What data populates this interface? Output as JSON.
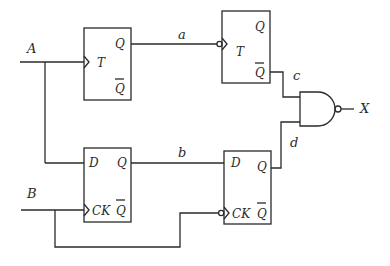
{
  "diagram": {
    "type": "logic-circuit",
    "inputs": {
      "a_input": "A",
      "b_input": "B"
    },
    "output": "X",
    "signals": {
      "a": "a",
      "b": "b",
      "c": "c",
      "d": "d"
    },
    "flipflops": [
      {
        "id": "ff1",
        "type": "T",
        "pins": {
          "in": "T",
          "q": "Q",
          "qbar": "Q"
        },
        "clock_inverted": false
      },
      {
        "id": "ff2",
        "type": "T",
        "pins": {
          "in": "T",
          "q": "Q",
          "qbar": "Q"
        },
        "clock_inverted": true
      },
      {
        "id": "ff3",
        "type": "D",
        "pins": {
          "d": "D",
          "ck": "CK",
          "q": "Q",
          "qbar": "Q"
        },
        "clock_inverted": false
      },
      {
        "id": "ff4",
        "type": "D",
        "pins": {
          "d": "D",
          "ck": "CK",
          "q": "Q",
          "qbar": "Q"
        },
        "clock_inverted": true
      }
    ],
    "gate": {
      "type": "NAND",
      "inputs": [
        "c",
        "d"
      ],
      "output": "X"
    },
    "colors": {
      "line": "#2a2a2a",
      "background": "#ffffff"
    }
  }
}
